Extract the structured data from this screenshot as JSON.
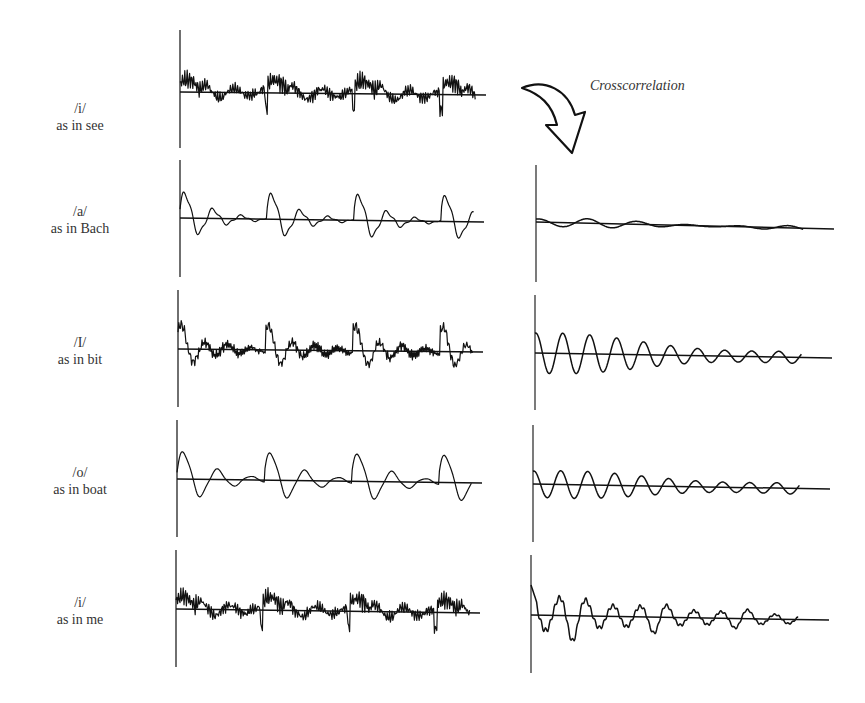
{
  "figure": {
    "annotation": "Crosscorrelation",
    "arrow": "curved-down-arrow"
  },
  "rows": [
    {
      "ipa": "/i/",
      "example": "as in see",
      "label_top": 100,
      "wave": {
        "axis_x": 180,
        "top": 30,
        "bottom": 148,
        "base_y0": 92,
        "base_y1": 95,
        "x_end": 482,
        "type": "i"
      },
      "xcorr": null
    },
    {
      "ipa": "/a/",
      "example": "as in Bach",
      "label_top": 203,
      "wave": {
        "axis_x": 180,
        "top": 160,
        "bottom": 277,
        "base_y0": 218,
        "base_y1": 222,
        "x_end": 480,
        "type": "a"
      },
      "xcorr": {
        "axis_x": 536,
        "top": 165,
        "bottom": 282,
        "base_y0": 222,
        "base_y1": 229,
        "x_end": 834,
        "amp": 5,
        "decay": 0.6,
        "type": "flat"
      }
    },
    {
      "ipa": "/I/",
      "example": "as in bit",
      "label_top": 334,
      "wave": {
        "axis_x": 178,
        "top": 290,
        "bottom": 407,
        "base_y0": 349,
        "base_y1": 352,
        "x_end": 479,
        "type": "I"
      },
      "xcorr": {
        "axis_x": 535,
        "top": 295,
        "bottom": 410,
        "base_y0": 353,
        "base_y1": 358,
        "x_end": 832,
        "amp": 20,
        "decay": 1.3,
        "type": "sine"
      }
    },
    {
      "ipa": "/o/",
      "example": "as in boat",
      "label_top": 464,
      "wave": {
        "axis_x": 177,
        "top": 420,
        "bottom": 537,
        "base_y0": 479,
        "base_y1": 483,
        "x_end": 478,
        "type": "o"
      },
      "xcorr": {
        "axis_x": 533,
        "top": 425,
        "bottom": 542,
        "base_y0": 484,
        "base_y1": 489,
        "x_end": 830,
        "amp": 13,
        "decay": 0.9,
        "type": "sine"
      }
    },
    {
      "ipa": "/i/",
      "example": "as in me",
      "label_top": 594,
      "wave": {
        "axis_x": 176,
        "top": 550,
        "bottom": 667,
        "base_y0": 609,
        "base_y1": 613,
        "x_end": 476,
        "type": "i"
      },
      "xcorr": {
        "axis_x": 531,
        "top": 555,
        "bottom": 673,
        "base_y0": 615,
        "base_y1": 620,
        "x_end": 829,
        "amp": 30,
        "decay": 1.4,
        "type": "jagged"
      }
    }
  ],
  "chart_data": {
    "type": "line",
    "panels_left": [
      {
        "label": "/i/ as in see",
        "description": "periodic vowel waveform, 4 pitch periods, high-frequency ripple"
      },
      {
        "label": "/a/ as in Bach",
        "description": "periodic vowel waveform, 4 pitch periods, large low-frequency oscillations"
      },
      {
        "label": "/I/ as in bit",
        "description": "periodic vowel waveform, 4 pitch periods"
      },
      {
        "label": "/o/ as in boat",
        "description": "periodic vowel waveform, 4 pitch periods, smooth oscillations"
      },
      {
        "label": "/i/ as in me",
        "description": "periodic vowel waveform, 4 pitch periods, similar to /i/ as in see"
      }
    ],
    "panels_right": [
      {
        "label": "crosscorrelation /i/ see vs /a/ Bach",
        "relative_amplitude": "very low"
      },
      {
        "label": "crosscorrelation /i/ see vs /I/ bit",
        "relative_amplitude": "medium, decaying"
      },
      {
        "label": "crosscorrelation /i/ see vs /o/ boat",
        "relative_amplitude": "low-medium, decaying"
      },
      {
        "label": "crosscorrelation /i/ see vs /i/ me",
        "relative_amplitude": "high, decaying, jagged"
      }
    ],
    "annotations": [
      "Crosscorrelation"
    ],
    "xlabel": "",
    "ylabel": "",
    "grid": false
  }
}
